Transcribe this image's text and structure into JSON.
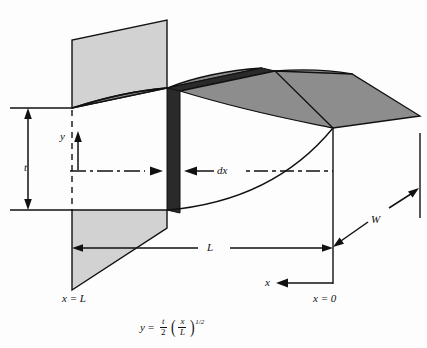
{
  "figure": {
    "type": "engineering-diagram",
    "labels": {
      "thickness": "t",
      "height_coord": "y",
      "element_width": "dx",
      "length": "L",
      "width": "W",
      "axis": "x",
      "station_root": "x = L",
      "station_tip": "x = 0"
    },
    "equation": {
      "lhs": "y",
      "equals": "=",
      "coefficient_num": "t",
      "coefficient_den": "2",
      "ratio_num": "x",
      "ratio_den": "L",
      "exponent": "1/2",
      "plain": "y = (t/2)(x/L)^(1/2)"
    },
    "colors": {
      "plate_light": "#d2d2d2",
      "surface_mid": "#8d8d8d",
      "element_dark": "#2a2a2a",
      "outline": "#111111",
      "background": "#fdfdfd"
    },
    "annotations": [
      {
        "name": "t-dimension",
        "label": "t",
        "style": "double-arrow-vertical"
      },
      {
        "name": "y-arrow",
        "label": "y",
        "style": "single-arrow-up"
      },
      {
        "name": "dx-callout",
        "label": "dx",
        "style": "opposed-arrows-dashdot"
      },
      {
        "name": "L-dimension",
        "label": "L",
        "style": "double-arrow-horizontal"
      },
      {
        "name": "W-dimension",
        "label": "W",
        "style": "double-arrow-diagonal"
      },
      {
        "name": "x-axis-arrow",
        "label": "x",
        "style": "single-arrow-left"
      }
    ]
  }
}
